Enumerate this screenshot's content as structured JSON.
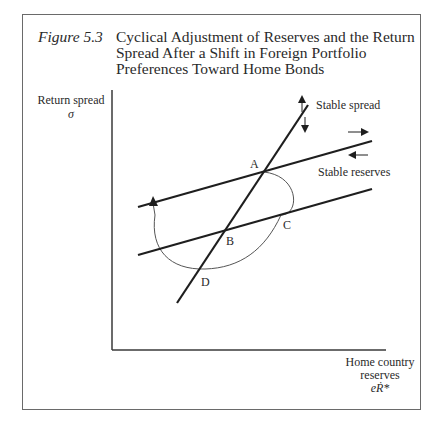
{
  "figure": {
    "number": "Figure 5.3",
    "title_lines": [
      "Cyclical Adjustment of Reserves and the Return",
      "Spread After a Shift in Foreign Portfolio",
      "Preferences Toward Home Bonds"
    ]
  },
  "axes": {
    "y_label": "Return spread",
    "y_symbol": "σ",
    "x_label_lines": [
      "Home country",
      "reserves"
    ],
    "x_symbol": "eṘ*"
  },
  "curves": {
    "stable_spread": "Stable spread",
    "stable_reserves": "Stable reserves"
  },
  "points": {
    "A": "A",
    "B": "B",
    "C": "C",
    "D": "D"
  },
  "colors": {
    "line": "#1e1e1e",
    "cycle": "#555555",
    "frame": "#6a6a6a"
  }
}
